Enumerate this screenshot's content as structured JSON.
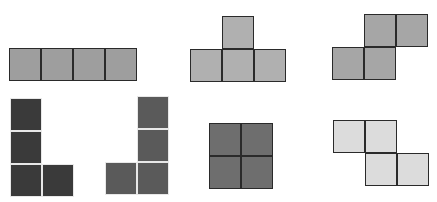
{
  "pieces": [
    {
      "name": "I-tetromino",
      "color": "#9e9e9e",
      "style": "outlined",
      "x": 9,
      "y": 48,
      "cells": [
        [
          0,
          0
        ],
        [
          1,
          0
        ],
        [
          2,
          0
        ],
        [
          3,
          0
        ]
      ]
    },
    {
      "name": "T-tetromino",
      "color": "#b0b0b0",
      "style": "outlined",
      "x": 190,
      "y": 16,
      "cells": [
        [
          1,
          0
        ],
        [
          0,
          1
        ],
        [
          1,
          1
        ],
        [
          2,
          1
        ]
      ]
    },
    {
      "name": "S-tetromino",
      "color": "#a6a6a6",
      "style": "outlined",
      "x": 332,
      "y": 14,
      "cells": [
        [
          1,
          0
        ],
        [
          2,
          0
        ],
        [
          0,
          1
        ],
        [
          1,
          1
        ]
      ]
    },
    {
      "name": "L-tetromino",
      "color": "#3a3a3a",
      "style": "gapped",
      "x": 10,
      "y": 98,
      "cells": [
        [
          0,
          0
        ],
        [
          0,
          1
        ],
        [
          0,
          2
        ],
        [
          1,
          2
        ]
      ]
    },
    {
      "name": "J-tetromino",
      "color": "#5a5a5a",
      "style": "gapped",
      "x": 105,
      "y": 96,
      "cells": [
        [
          1,
          0
        ],
        [
          1,
          1
        ],
        [
          0,
          2
        ],
        [
          1,
          2
        ]
      ]
    },
    {
      "name": "O-tetromino",
      "color": "#6e6e6e",
      "style": "outlined",
      "x": 209,
      "y": 123,
      "cells": [
        [
          0,
          0
        ],
        [
          1,
          0
        ],
        [
          0,
          1
        ],
        [
          1,
          1
        ]
      ]
    },
    {
      "name": "Z-tetromino",
      "color": "#dcdcdc",
      "style": "outlined",
      "x": 333,
      "y": 120,
      "cells": [
        [
          0,
          0
        ],
        [
          1,
          0
        ],
        [
          1,
          1
        ],
        [
          2,
          1
        ]
      ]
    }
  ]
}
